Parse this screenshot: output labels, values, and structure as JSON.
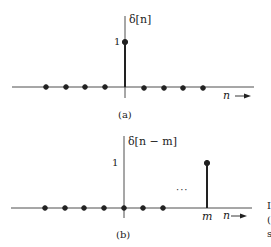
{
  "panels": [
    {
      "id": "a",
      "ylabel": "δ[n]",
      "caption": "(a)",
      "amplitude_label": "1",
      "xlabel": "n",
      "impulse_position_label": "",
      "ellipsis": ""
    },
    {
      "id": "b",
      "ylabel": "δ[n − m]",
      "caption": "(b)",
      "amplitude_label": "1",
      "xlabel": "n",
      "impulse_position_label": "m",
      "ellipsis": "···"
    }
  ],
  "cut_text": [
    "I",
    "(",
    "s"
  ]
}
